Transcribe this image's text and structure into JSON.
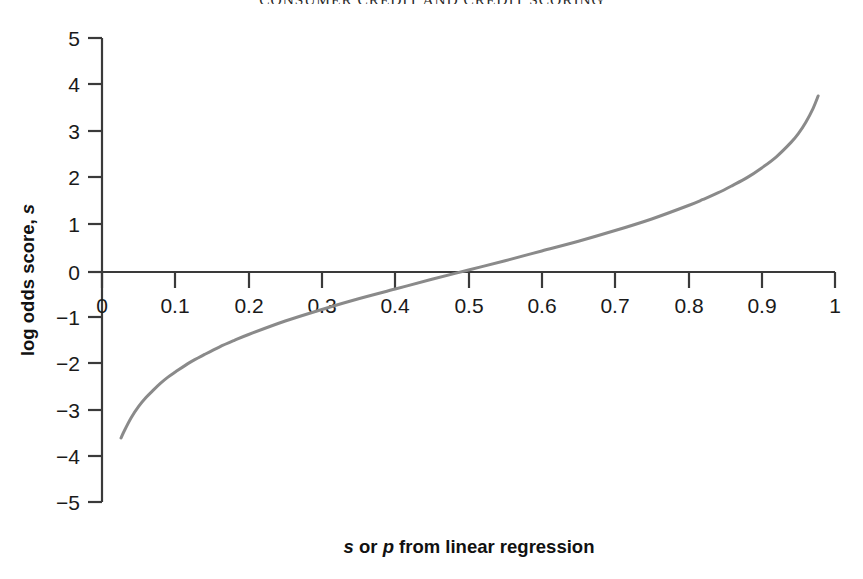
{
  "page": {
    "running_head": "CONSUMER CREDIT AND CREDIT SCORING"
  },
  "chart_data": {
    "type": "line",
    "title": "",
    "xlabel_parts": {
      "sym1": "s",
      "mid": " or ",
      "sym2": "p",
      "rest": " from linear regression"
    },
    "xlabel": "s or p from linear regression",
    "ylabel_parts": {
      "main": "log odds score, ",
      "sym": "s"
    },
    "ylabel": "log odds score, s",
    "xlim": [
      0,
      1
    ],
    "ylim": [
      -5,
      5
    ],
    "xticks": [
      "0",
      "0.1",
      "0.2",
      "0.3",
      "0.4",
      "0.5",
      "0.6",
      "0.7",
      "0.8",
      "0.9",
      "1"
    ],
    "xtick_values": [
      0,
      0.1,
      0.2,
      0.3,
      0.4,
      0.5,
      0.6,
      0.7,
      0.8,
      0.9,
      1
    ],
    "yticks": [
      "5",
      "4",
      "3",
      "2",
      "1",
      "0",
      "−1",
      "−2",
      "−3",
      "−4",
      "−5"
    ],
    "ytick_values": [
      5,
      4,
      3,
      2,
      1,
      0,
      -1,
      -2,
      -3,
      -4,
      -5
    ],
    "grid": false,
    "legend": false,
    "axis_color": "#3a3a3a",
    "line_color": "#8a8a8a",
    "series": [
      {
        "name": "log odds transform",
        "formula": "s = ln(p/(1-p))",
        "x": [
          0.026,
          0.03,
          0.04,
          0.05,
          0.06,
          0.07,
          0.08,
          0.09,
          0.1,
          0.12,
          0.14,
          0.16,
          0.18,
          0.2,
          0.25,
          0.3,
          0.35,
          0.4,
          0.45,
          0.5,
          0.55,
          0.6,
          0.65,
          0.7,
          0.75,
          0.8,
          0.82,
          0.84,
          0.86,
          0.88,
          0.9,
          0.92,
          0.94,
          0.95,
          0.96,
          0.97,
          0.977
        ],
        "y": [
          -3.62,
          -3.48,
          -3.18,
          -2.94,
          -2.75,
          -2.59,
          -2.44,
          -2.31,
          -2.2,
          -1.99,
          -1.82,
          -1.66,
          -1.52,
          -1.39,
          -1.1,
          -0.85,
          -0.62,
          -0.41,
          -0.2,
          0.0,
          0.2,
          0.41,
          0.62,
          0.85,
          1.1,
          1.39,
          1.52,
          1.66,
          1.82,
          1.99,
          2.2,
          2.44,
          2.75,
          2.94,
          3.18,
          3.48,
          3.75
        ]
      }
    ]
  }
}
